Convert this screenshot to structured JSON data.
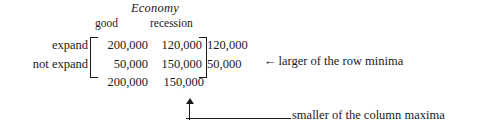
{
  "figure": {
    "title": "Economy",
    "column_headers": [
      "good",
      "recession"
    ],
    "row_labels": [
      "expand",
      "not expand"
    ],
    "matrix": [
      [
        "200,000",
        "120,000"
      ],
      [
        "50,000",
        "150,000"
      ]
    ],
    "row_minima": [
      "120,000",
      "50,000"
    ],
    "column_maxima": [
      "200,000",
      "150,000"
    ],
    "row_minima_annotation": {
      "arrow": "←",
      "label": "larger of the row minima"
    },
    "column_maxima_annotation": {
      "arrow": "↑",
      "label": "smaller of the column maxima"
    }
  }
}
